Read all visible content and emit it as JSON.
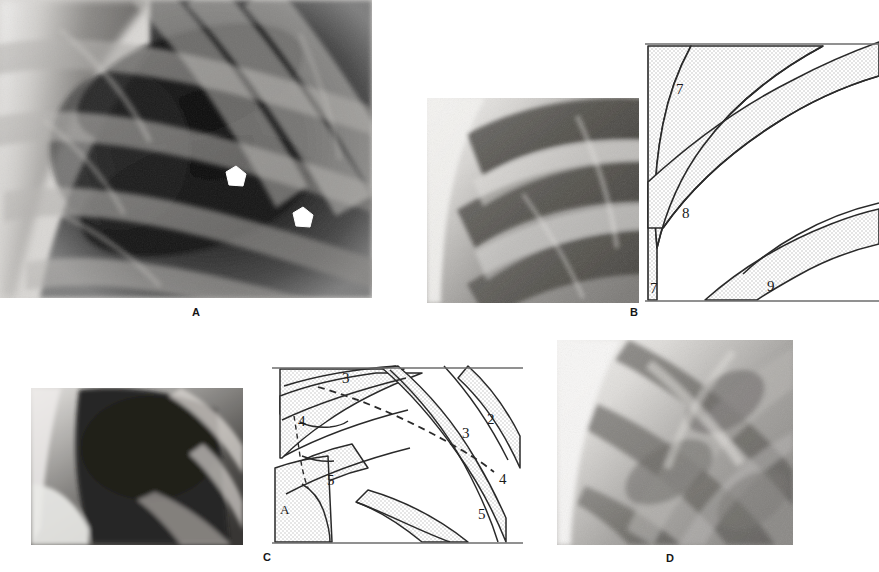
{
  "figure": {
    "background_color": "#ffffff",
    "width": 879,
    "height": 572,
    "kind": "radiographic-figure-with-line-diagrams"
  },
  "panels": [
    {
      "id": "A",
      "caption": "A",
      "type": "radiograph",
      "description": "Magnified chest radiograph of right upper/mid hemithorax showing overlapping posterior and anterior rib shadows",
      "rect": [
        0,
        0,
        372,
        298
      ],
      "caption_pos": [
        192,
        306
      ],
      "markers": [
        {
          "name": "arrowhead-marker-1",
          "pos": [
            235,
            177
          ],
          "color": "#ffffff"
        },
        {
          "name": "arrowhead-marker-2",
          "pos": [
            302,
            218
          ],
          "color": "#ffffff"
        }
      ]
    },
    {
      "id": "B",
      "caption": "B",
      "type": "radiograph-with-diagram",
      "xray_rect": [
        427,
        98,
        212,
        205
      ],
      "diagram_rect": [
        645,
        38,
        234,
        265
      ],
      "caption_pos": [
        630,
        306
      ],
      "diagram_labels": [
        {
          "text": "7",
          "x": 31,
          "y": 56
        },
        {
          "text": "8",
          "x": 37,
          "y": 180
        },
        {
          "text": "7",
          "x": 7,
          "y": 253
        },
        {
          "text": "9",
          "x": 124,
          "y": 253
        }
      ],
      "diagram_legend": "Stippled bands = posterior rib segments numbered 7, 8 and 9"
    },
    {
      "id": "C",
      "caption": "C",
      "type": "radiograph-with-diagram",
      "xray_rect": [
        31,
        388,
        212,
        157
      ],
      "diagram_rect": [
        272,
        364,
        251,
        181
      ],
      "caption_pos": [
        263,
        551
      ],
      "diagram_labels": [
        {
          "text": "3",
          "x": 72,
          "y": 17
        },
        {
          "text": "4",
          "x": 28,
          "y": 59
        },
        {
          "text": "5",
          "x": 57,
          "y": 119
        },
        {
          "text": "A",
          "x": 11,
          "y": 146
        },
        {
          "text": "2",
          "x": 218,
          "y": 57
        },
        {
          "text": "3",
          "x": 193,
          "y": 70
        },
        {
          "text": "4",
          "x": 229,
          "y": 116
        },
        {
          "text": "5",
          "x": 209,
          "y": 150
        }
      ],
      "diagram_legend": "Stippled bands = rib segments 2-5; dashed line marks the plane of the interlobar fissure"
    },
    {
      "id": "D",
      "caption": "D",
      "type": "radiograph",
      "description": "Magnified chest radiograph showing crossing rib shadows of the lower hemithorax",
      "rect": [
        557,
        340,
        236,
        205
      ],
      "caption_pos": [
        666,
        552
      ]
    }
  ],
  "colors": {
    "stipple_fill": "#e3e3e3",
    "line": "#2a2a2a",
    "border": "#6d6d6d",
    "label_text": "#1a1a1a",
    "marker": "#ffffff",
    "page_bg": "#ffffff"
  }
}
